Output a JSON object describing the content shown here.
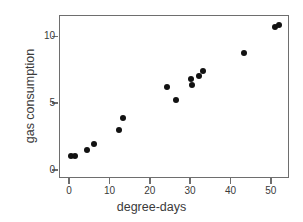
{
  "chart_data": {
    "type": "scatter",
    "title": "",
    "xlabel": "degree-days",
    "ylabel": "gas consumption",
    "xlim": [
      -2.5,
      54.5
    ],
    "ylim": [
      -0.6,
      11.6
    ],
    "xticks": [
      0,
      10,
      20,
      30,
      40,
      50
    ],
    "xticklabels": [
      "0",
      "10",
      "20",
      "30",
      "40",
      "50"
    ],
    "yticks": [
      0,
      5,
      10
    ],
    "yticklabels": [
      "0",
      "5",
      "10"
    ],
    "grid": false,
    "legend": false,
    "marker": "filled-circle",
    "marker_color": "#121212",
    "frame_color": "#6e6e6e",
    "background": "#ffffff",
    "points": [
      {
        "x": 0.2,
        "y": 1.15
      },
      {
        "x": 1.3,
        "y": 1.15
      },
      {
        "x": 4.2,
        "y": 1.6
      },
      {
        "x": 6.0,
        "y": 2.05
      },
      {
        "x": 12.0,
        "y": 3.05
      },
      {
        "x": 13.0,
        "y": 4.0
      },
      {
        "x": 24.0,
        "y": 6.25
      },
      {
        "x": 26.2,
        "y": 5.3
      },
      {
        "x": 30.0,
        "y": 6.85
      },
      {
        "x": 30.2,
        "y": 6.4
      },
      {
        "x": 32.0,
        "y": 7.1
      },
      {
        "x": 33.0,
        "y": 7.45
      },
      {
        "x": 43.2,
        "y": 8.85
      },
      {
        "x": 50.8,
        "y": 10.8
      },
      {
        "x": 51.8,
        "y": 10.95
      }
    ]
  }
}
